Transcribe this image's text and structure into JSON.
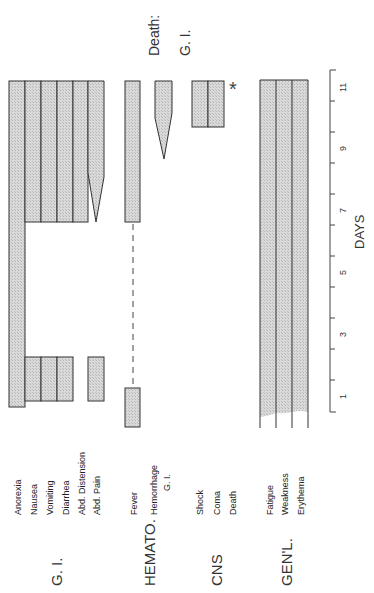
{
  "axis": {
    "label": "DAYS",
    "tick_labels": [
      "1",
      "3",
      "5",
      "7",
      "9",
      "11"
    ],
    "range_days": [
      0.5,
      11.5
    ]
  },
  "annotation": {
    "death_label": "Death:",
    "death_cause": "G. I.",
    "asterisk": "*"
  },
  "groups": [
    {
      "label": "G. I.",
      "symptoms": [
        {
          "name": "Anorexia",
          "periods": [
            [
              0.6,
              11.5
            ]
          ]
        },
        {
          "name": "Nausea",
          "periods": [
            [
              0.8,
              2.2
            ],
            [
              6.6,
              11.5
            ]
          ]
        },
        {
          "name": "Vomiting",
          "periods": [
            [
              0.8,
              2.2
            ],
            [
              6.6,
              11.5
            ]
          ]
        },
        {
          "name": "Diarrhea",
          "periods": [
            [
              0.8,
              2.2
            ],
            [
              6.6,
              11.5
            ]
          ]
        },
        {
          "name": "Abd. Distension",
          "periods": [
            [
              6.6,
              11.5
            ]
          ]
        },
        {
          "name": "Abd. Pain",
          "periods": [
            [
              0.8,
              2.2
            ],
            [
              6.6,
              11.5
            ]
          ],
          "note": "tapered onset near day 7-8"
        }
      ]
    },
    {
      "label": "HEMATO.",
      "symptoms": [
        {
          "name": "Fever",
          "periods": [
            [
              0.0,
              1.3
            ],
            [
              6.6,
              11.5
            ]
          ],
          "note": "dashed line between periods"
        },
        {
          "name": "Hemorrhage",
          "sub": "G. I.",
          "periods": [
            [
              8.5,
              11.5
            ]
          ],
          "note": "tapered onset"
        }
      ]
    },
    {
      "label": "CNS",
      "symptoms": [
        {
          "name": "Shock",
          "periods": [
            [
              9.6,
              11.5
            ]
          ]
        },
        {
          "name": "Coma",
          "periods": [
            [
              9.6,
              11.5
            ]
          ]
        },
        {
          "name": "Death",
          "periods": [],
          "note": "asterisk at day 11.5"
        }
      ]
    },
    {
      "label": "GEN'L.",
      "symptoms": [
        {
          "name": "Fatigue",
          "periods": [
            [
              0.5,
              11.5
            ]
          ]
        },
        {
          "name": "Weakness",
          "periods": [
            [
              0.5,
              11.5
            ]
          ]
        },
        {
          "name": "Erythema",
          "periods": [
            [
              0.5,
              11.5
            ]
          ]
        }
      ]
    }
  ]
}
